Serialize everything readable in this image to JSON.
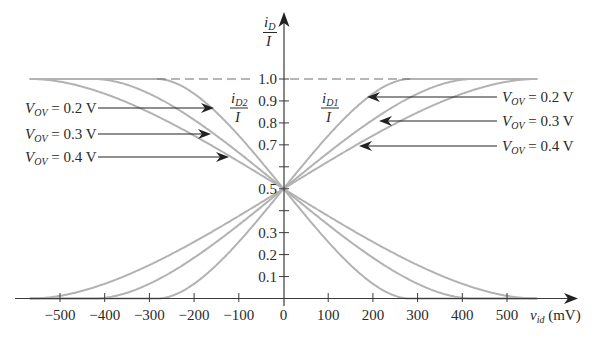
{
  "chart_data": {
    "type": "line",
    "title": "",
    "xlabel": {
      "var": "v",
      "sub": "id",
      "unit": " (mV)"
    },
    "ylabel": {
      "num_var": "i",
      "num_sub": "D",
      "den": "I"
    },
    "xlim": [
      -566,
      566
    ],
    "ylim": [
      0,
      1.0
    ],
    "grid": false,
    "legend_position": "none",
    "x_ticks": [
      -500,
      -400,
      -300,
      -200,
      -100,
      0,
      100,
      200,
      300,
      400,
      500
    ],
    "x_tick_labels": [
      "−500",
      "−400",
      "−300",
      "−200",
      "−100",
      "0",
      "100",
      "200",
      "300",
      "400",
      "500"
    ],
    "y_ticks": [
      0.1,
      0.2,
      0.3,
      0.4,
      0.5,
      0.6,
      0.7,
      0.8,
      0.9,
      1.0
    ],
    "y_tick_labels": [
      "0.1",
      "0.2",
      "0.3",
      "",
      "0.5",
      "",
      "0.7",
      "0.8",
      "0.9",
      "1.0"
    ],
    "reference_line": {
      "y": 1.0,
      "style": "dashed",
      "x_range": [
        -283,
        283
      ]
    },
    "curve_labels": {
      "id2": {
        "var": "i",
        "sub": "D2",
        "den": "I"
      },
      "id1": {
        "var": "i",
        "sub": "D1",
        "den": "I"
      }
    },
    "x": [
      -500,
      -400,
      -300,
      -200,
      -100,
      0,
      100,
      200,
      300,
      400,
      500
    ],
    "series": [
      {
        "name": "iD1/I, VOV = 0.2 V",
        "vov": 0.2,
        "values": [
          0,
          0,
          0,
          0.067,
          0.258,
          0.5,
          0.742,
          0.933,
          1.0,
          1.0,
          1.0
        ]
      },
      {
        "name": "iD1/I, VOV = 0.3 V",
        "vov": 0.3,
        "values": [
          0,
          0.003,
          0.067,
          0.186,
          0.336,
          0.5,
          0.664,
          0.814,
          0.933,
          0.997,
          1.0
        ]
      },
      {
        "name": "iD1/I, VOV = 0.4 V",
        "vov": 0.4,
        "values": [
          0.012,
          0.067,
          0.152,
          0.258,
          0.376,
          0.5,
          0.624,
          0.742,
          0.848,
          0.933,
          0.988
        ]
      },
      {
        "name": "iD2/I, VOV = 0.2 V",
        "vov": 0.2,
        "values": [
          1.0,
          1.0,
          1.0,
          0.933,
          0.742,
          0.5,
          0.258,
          0.067,
          0,
          0,
          0
        ]
      },
      {
        "name": "iD2/I, VOV = 0.3 V",
        "vov": 0.3,
        "values": [
          1.0,
          0.997,
          0.933,
          0.814,
          0.664,
          0.5,
          0.336,
          0.186,
          0.067,
          0.003,
          0
        ]
      },
      {
        "name": "iD2/I, VOV = 0.4 V",
        "vov": 0.4,
        "values": [
          0.988,
          0.933,
          0.848,
          0.742,
          0.624,
          0.5,
          0.376,
          0.258,
          0.152,
          0.067,
          0.012
        ]
      }
    ],
    "annotations": {
      "left": [
        {
          "var": "V",
          "sub": "OV",
          "text": " = 0.2 V",
          "vov": 0.2
        },
        {
          "var": "V",
          "sub": "OV",
          "text": " = 0.3 V",
          "vov": 0.3
        },
        {
          "var": "V",
          "sub": "OV",
          "text": " = 0.4 V",
          "vov": 0.4
        }
      ],
      "right": [
        {
          "var": "V",
          "sub": "OV",
          "text": " = 0.2 V",
          "vov": 0.2
        },
        {
          "var": "V",
          "sub": "OV",
          "text": " = 0.3 V",
          "vov": 0.3
        },
        {
          "var": "V",
          "sub": "OV",
          "text": " = 0.4 V",
          "vov": 0.4
        }
      ]
    },
    "colors": {
      "curve": "#b2b2b2",
      "axis": "#3a3a3a",
      "dashed": "#6e6e6e",
      "text": "#2a2a2a"
    }
  }
}
